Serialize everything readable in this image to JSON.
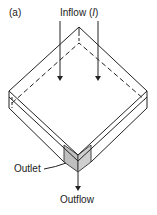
{
  "figure": {
    "panel_label": "(a)",
    "inflow_label": "Inflow (",
    "inflow_symbol": "I",
    "inflow_close": ")",
    "outlet_label": "Outlet",
    "outflow_label": "Outflow"
  },
  "colors": {
    "line": "#222222",
    "outlet_fill": "#bfbfbf"
  }
}
